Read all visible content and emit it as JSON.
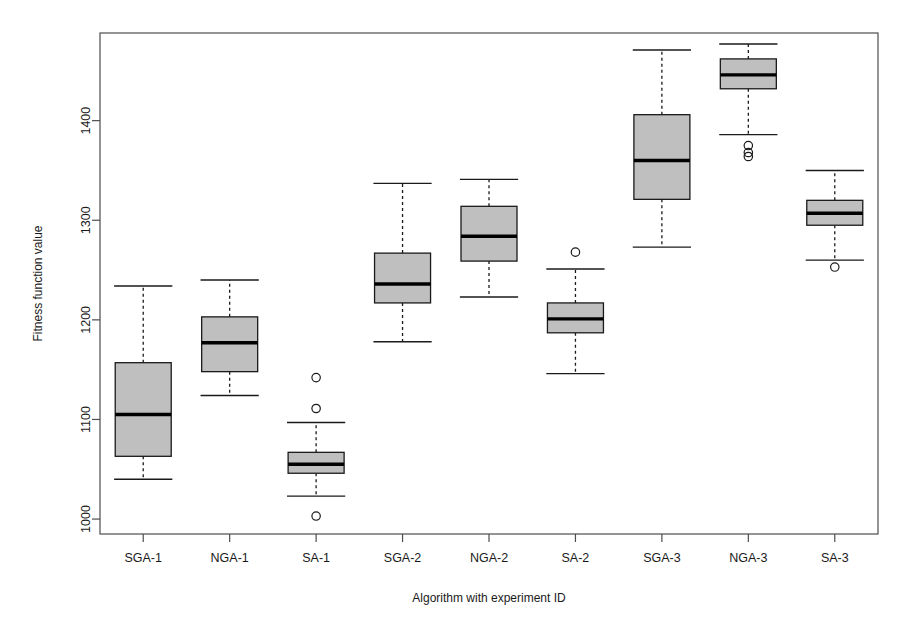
{
  "chart_data": {
    "type": "box",
    "title": "",
    "xlabel": "Algorithm with experiment ID",
    "ylabel": "Fitness function value",
    "categories": [
      "SGA-1",
      "NGA-1",
      "SA-1",
      "SGA-2",
      "NGA-2",
      "SA-2",
      "SGA-3",
      "NGA-3",
      "SA-3"
    ],
    "ylim": [
      985,
      1488
    ],
    "yticks": [
      1000,
      1100,
      1200,
      1300,
      1400
    ],
    "ytick_labels": [
      "1000",
      "1100",
      "1200",
      "1300",
      "1400"
    ],
    "grid": false,
    "legend": "none",
    "box_fill": "#bfbfbf",
    "box_stroke": "#1a1a1a",
    "median_stroke": "#000000",
    "whisker_style": "dashed",
    "boxes": [
      {
        "label": "SGA-1",
        "whisker_low": 1040,
        "q1": 1063,
        "median": 1105,
        "q3": 1157,
        "whisker_high": 1234,
        "outliers": []
      },
      {
        "label": "NGA-1",
        "whisker_low": 1124,
        "q1": 1148,
        "median": 1177,
        "q3": 1203,
        "whisker_high": 1240,
        "outliers": []
      },
      {
        "label": "SA-1",
        "whisker_low": 1023,
        "q1": 1046,
        "median": 1055,
        "q3": 1067,
        "whisker_high": 1097,
        "outliers": [
          1142,
          1111,
          1003
        ]
      },
      {
        "label": "SGA-2",
        "whisker_low": 1178,
        "q1": 1217,
        "median": 1236,
        "q3": 1267,
        "whisker_high": 1337,
        "outliers": []
      },
      {
        "label": "NGA-2",
        "whisker_low": 1223,
        "q1": 1259,
        "median": 1284,
        "q3": 1314,
        "whisker_high": 1341,
        "outliers": []
      },
      {
        "label": "SA-2",
        "whisker_low": 1146,
        "q1": 1187,
        "median": 1201,
        "q3": 1217,
        "whisker_high": 1251,
        "outliers": [
          1268
        ]
      },
      {
        "label": "SGA-3",
        "whisker_low": 1273,
        "q1": 1321,
        "median": 1360,
        "q3": 1406,
        "whisker_high": 1471,
        "outliers": []
      },
      {
        "label": "NGA-3",
        "whisker_low": 1386,
        "q1": 1432,
        "median": 1446,
        "q3": 1462,
        "whisker_high": 1477,
        "outliers": [
          1375,
          1368,
          1364
        ]
      },
      {
        "label": "SA-3",
        "whisker_low": 1260,
        "q1": 1295,
        "median": 1307,
        "q3": 1320,
        "whisker_high": 1350,
        "outliers": [
          1253
        ]
      }
    ]
  },
  "plot_geometry": {
    "frame_left": 100,
    "frame_right": 878,
    "frame_top": 33,
    "frame_bottom": 534,
    "box_width": 56
  }
}
